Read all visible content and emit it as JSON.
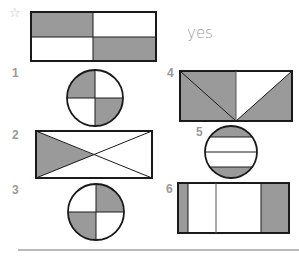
{
  "example": {
    "marker": "☆",
    "answer": "yes"
  },
  "questions": [
    {
      "number": "1",
      "shape": "circle",
      "description": "circle divided into 4 quarters, top-left and bottom-right shaded"
    },
    {
      "number": "2",
      "shape": "rectangle",
      "description": "rectangle divided by both diagonals into 4 triangles, left triangle shaded"
    },
    {
      "number": "3",
      "shape": "circle",
      "description": "circle divided into 4 quarters, top-right and bottom-left shaded"
    },
    {
      "number": "4",
      "shape": "rectangle",
      "description": "rectangle split at center into halves, left half shaded with diagonal, right half with shaded right triangle and white middle triangle"
    },
    {
      "number": "5",
      "shape": "circle",
      "description": "circle divided by 3 horizontal lines, top and bottom segments shaded"
    },
    {
      "number": "6",
      "shape": "rectangle",
      "description": "rectangle divided by 3 vertical lines into 4 strips of unequal width, leftmost and rightmost shaded"
    }
  ],
  "colors": {
    "shade": "#9a9a9a",
    "stroke": "#1a1a1a",
    "label": "#9a9a9a"
  }
}
